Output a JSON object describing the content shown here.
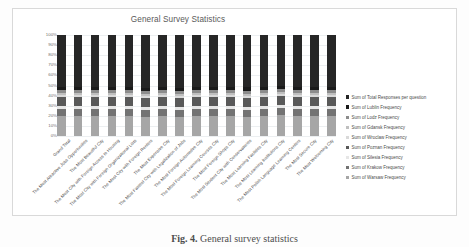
{
  "chart_data": {
    "type": "bar",
    "subtype": "100% stacked column",
    "title": "General Survey Statistics",
    "xlabel": "",
    "ylabel": "",
    "ylim": [
      0,
      100
    ],
    "ytick_labels": [
      "100%",
      "90%",
      "80%",
      "70%",
      "60%",
      "50%",
      "40%",
      "30%",
      "20%",
      "10%",
      "0%"
    ],
    "ytick_values": [
      100,
      90,
      80,
      70,
      60,
      50,
      40,
      30,
      20,
      10,
      0
    ],
    "grid": true,
    "legend_position": "right",
    "categories": [
      "Grand Total",
      "The Most Attractive Jobs Opportunities",
      "The Most Beautiful City",
      "The Most City with Foreign Access to Housing",
      "The Most City with Foreign Organizational Lists",
      "The Most City with Foreign Renters",
      "The Most Expensive City",
      "The Most Fastest City with Legalization of Jobs",
      "The Most Foreign Automotive City",
      "The Most Foreign Learning Courses City",
      "The Most Foreign Shops City",
      "The Most Student City with Conservatories",
      "The Most Learning Facilities City",
      "The Most Learning Institutions City",
      "The Most Polish Language Learning Centers",
      "The Most Secure City",
      "The Most Welcoming City"
    ],
    "series": [
      {
        "name": "Sum of Total Responses per question",
        "color": "#262626",
        "values": [
          51,
          51,
          51,
          51,
          51,
          52,
          51,
          52,
          51,
          51,
          51,
          51,
          51,
          50,
          51,
          51,
          51
        ]
      },
      {
        "name": "Sum of Lublin Frequency",
        "color": "#1a1a1a",
        "values": [
          3,
          3,
          3,
          3,
          3,
          3,
          3,
          3,
          3,
          3,
          3,
          4,
          3,
          3,
          3,
          3,
          3
        ]
      },
      {
        "name": "Sum of Lodz Frequency",
        "color": "#8c8c8c",
        "values": [
          3,
          3,
          3,
          3,
          3,
          3,
          3,
          3,
          3,
          3,
          3,
          3,
          3,
          3,
          3,
          3,
          3
        ]
      },
      {
        "name": "Sum of Gdansk Frequency",
        "color": "#bfbfbf",
        "values": [
          2,
          2,
          2,
          2,
          2,
          2,
          2,
          2,
          2,
          2,
          2,
          2,
          2,
          2,
          2,
          2,
          2
        ]
      },
      {
        "name": "Sum of Wroclaw Frequency",
        "color": "#d9d9d9",
        "values": [
          2,
          2,
          2,
          2,
          2,
          2,
          2,
          2,
          2,
          2,
          2,
          2,
          2,
          2,
          2,
          2,
          2
        ]
      },
      {
        "name": "Sum of Poznan Frequency",
        "color": "#595959",
        "values": [
          9,
          9,
          9,
          9,
          9,
          9,
          9,
          9,
          9,
          9,
          9,
          9,
          9,
          9,
          9,
          9,
          9
        ]
      },
      {
        "name": "Sum of Silesia Frequency",
        "color": "#e6e6e6",
        "values": [
          3,
          3,
          3,
          3,
          3,
          3,
          3,
          3,
          3,
          3,
          3,
          3,
          3,
          3,
          3,
          3,
          3
        ]
      },
      {
        "name": "Sum of Krakow Frequency",
        "color": "#737373",
        "values": [
          7,
          7,
          7,
          7,
          7,
          7,
          7,
          7,
          7,
          7,
          7,
          7,
          7,
          7,
          7,
          7,
          7
        ]
      },
      {
        "name": "Sum of Warsaw Frequency",
        "color": "#a6a6a6",
        "values": [
          20,
          20,
          20,
          20,
          20,
          19,
          20,
          19,
          20,
          20,
          20,
          19,
          20,
          21,
          20,
          20,
          20
        ]
      }
    ]
  },
  "caption": {
    "label": "Fig. 4.",
    "text": "General survey statistics"
  }
}
